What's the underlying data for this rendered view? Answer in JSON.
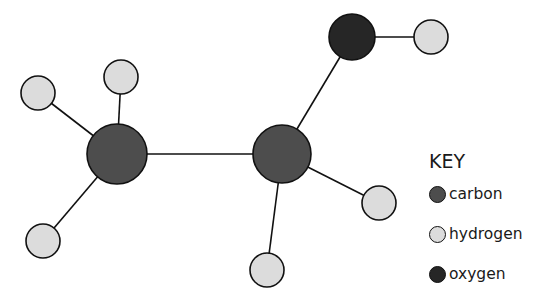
{
  "diagram": {
    "type": "molecule-ball-and-stick",
    "colors": {
      "carbon": "#4d4d4d",
      "hydrogen": "#dcdcdc",
      "oxygen": "#262626",
      "stroke": "#111111"
    },
    "atoms": [
      {
        "id": "C1",
        "element": "carbon",
        "x": 117,
        "y": 154,
        "r": 30
      },
      {
        "id": "C2",
        "element": "carbon",
        "x": 282,
        "y": 154,
        "r": 29
      },
      {
        "id": "O1",
        "element": "oxygen",
        "x": 352,
        "y": 37,
        "r": 23
      },
      {
        "id": "H1",
        "element": "hydrogen",
        "x": 121,
        "y": 77,
        "r": 17
      },
      {
        "id": "H2",
        "element": "hydrogen",
        "x": 38,
        "y": 93,
        "r": 17
      },
      {
        "id": "H3",
        "element": "hydrogen",
        "x": 43,
        "y": 241,
        "r": 17
      },
      {
        "id": "H4",
        "element": "hydrogen",
        "x": 431,
        "y": 37,
        "r": 17
      },
      {
        "id": "H5",
        "element": "hydrogen",
        "x": 379,
        "y": 203,
        "r": 17
      },
      {
        "id": "H6",
        "element": "hydrogen",
        "x": 267,
        "y": 270,
        "r": 17
      }
    ],
    "bonds": [
      [
        "C1",
        "C2"
      ],
      [
        "C1",
        "H1"
      ],
      [
        "C1",
        "H2"
      ],
      [
        "C1",
        "H3"
      ],
      [
        "C2",
        "O1"
      ],
      [
        "C2",
        "H5"
      ],
      [
        "C2",
        "H6"
      ],
      [
        "O1",
        "H4"
      ]
    ]
  },
  "key": {
    "title": "KEY",
    "items": [
      {
        "label": "carbon",
        "color": "#4d4d4d"
      },
      {
        "label": "hydrogen",
        "color": "#dcdcdc"
      },
      {
        "label": "oxygen",
        "color": "#262626"
      }
    ]
  }
}
